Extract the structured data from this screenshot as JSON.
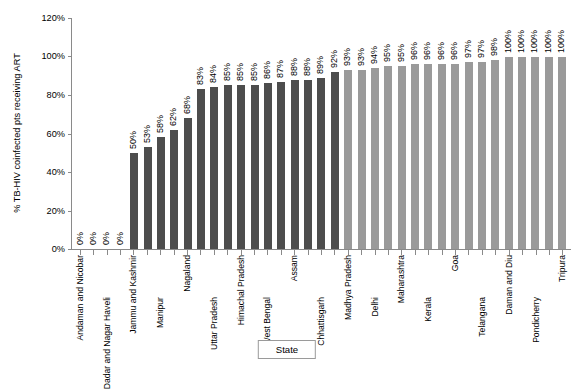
{
  "chart_data": {
    "type": "bar",
    "title": "",
    "xlabel": "State",
    "ylabel": "% TB-HIV coinfected pts receiving ART",
    "ylim": [
      0,
      120
    ],
    "ytick_labels": [
      "0%",
      "20%",
      "40%",
      "60%",
      "80%",
      "100%",
      "120%"
    ],
    "ytick_values": [
      0,
      20,
      40,
      60,
      80,
      100,
      120
    ],
    "grid": false,
    "legend": "none",
    "colors": {
      "dark_bar": "#4d4d4d",
      "light_bar": "#9a9a9a",
      "axis": "#8a8a8a"
    },
    "categories": [
      "Andaman and Nicobar",
      "",
      "Dadar and Nagar Haveli",
      "",
      "Jammu and Kashmir",
      "",
      "Manipur",
      "",
      "Nagaland",
      "",
      "Uttar Pradesh",
      "",
      "Himachal Pradesh",
      "",
      "West Bengal",
      "",
      "Assam",
      "",
      "Chhattisgarh",
      "",
      "Madhya Pradesh",
      "",
      "Delhi",
      "",
      "Maharashtra",
      "",
      "Kerala",
      "",
      "Goa",
      "",
      "Telangana",
      "",
      "Daman and Diu",
      "",
      "Pondicherry",
      "",
      "Tripura"
    ],
    "values": [
      0,
      0,
      0,
      0,
      50,
      53,
      58,
      62,
      68,
      83,
      84,
      85,
      85,
      85,
      86,
      87,
      88,
      88,
      89,
      92,
      93,
      93,
      94,
      95,
      95,
      96,
      96,
      96,
      96,
      97,
      97,
      98,
      100,
      100,
      100,
      100,
      100
    ],
    "value_labels": [
      "0%",
      "0%",
      "0%",
      "0%",
      "50%",
      "53%",
      "58%",
      "62%",
      "68%",
      "83%",
      "84%",
      "85%",
      "85%",
      "85%",
      "86%",
      "87%",
      "88%",
      "88%",
      "89%",
      "92%",
      "93%",
      "93%",
      "94%",
      "95%",
      "95%",
      "96%",
      "96%",
      "96%",
      "96%",
      "97%",
      "97%",
      "98%",
      "100%",
      "100%",
      "100%",
      "100%",
      "100%"
    ],
    "bar_shades": [
      "dark",
      "dark",
      "dark",
      "dark",
      "dark",
      "dark",
      "dark",
      "dark",
      "dark",
      "dark",
      "dark",
      "dark",
      "dark",
      "dark",
      "dark",
      "dark",
      "dark",
      "dark",
      "dark",
      "dark",
      "light",
      "light",
      "light",
      "light",
      "light",
      "light",
      "light",
      "light",
      "light",
      "light",
      "light",
      "light",
      "light",
      "light",
      "light",
      "light",
      "light"
    ],
    "category_labels_ordered": [
      "Andaman and Nicobar",
      "Dadar and Nagar Haveli",
      "Jammu and Kashmir",
      "Manipur",
      "Nagaland",
      "Uttar Pradesh",
      "Himachal Pradesh",
      "West Bengal",
      "Assam",
      "Chhattisgarh",
      "Madhya Pradesh",
      "Delhi",
      "Maharashtra",
      "Kerala",
      "Goa",
      "Telangana",
      "Daman and Diu",
      "Pondicherry",
      "Tripura"
    ]
  }
}
